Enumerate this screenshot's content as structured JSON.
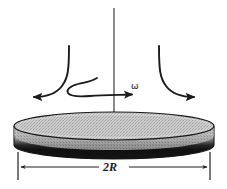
{
  "figure": {
    "type": "physics-schematic-diagram",
    "background_color": "#ffffff",
    "ink_color": "#1a1a1a"
  },
  "labels": {
    "angular_velocity": "ω",
    "diameter": "2R"
  },
  "colors": {
    "disk_top_fill": "#c9c9c9",
    "disk_rim_dark": "#141414",
    "disk_side_mid": "#9a9a9a",
    "outline": "#1a1a1a",
    "dimension_line": "#2b2b2b"
  },
  "geometry": {
    "disk": {
      "center_x": 114,
      "top_ellipse_cy": 126,
      "rx": 100,
      "ry": 14,
      "thickness": 19
    },
    "axis": {
      "x": 114,
      "y_top": 8,
      "y_bottom": 122
    },
    "dimension_line": {
      "y": 167,
      "x_left": 18,
      "x_right": 210
    }
  },
  "elements": [
    {
      "name": "rotation-axis-line",
      "kind": "line"
    },
    {
      "name": "inflow-streamline-left",
      "kind": "curved-arrow",
      "direction": "down-left"
    },
    {
      "name": "inflow-streamline-right",
      "kind": "curved-arrow",
      "direction": "down-right"
    },
    {
      "name": "rotation-spiral-arrow",
      "kind": "spiral-arrow",
      "direction": "right"
    },
    {
      "name": "disk-body",
      "kind": "cylinder"
    },
    {
      "name": "diameter-dimension",
      "kind": "double-arrow"
    }
  ]
}
